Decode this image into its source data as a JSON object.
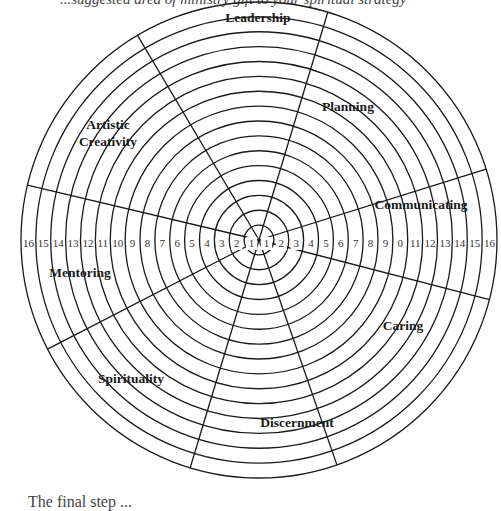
{
  "header": {
    "cut_off_text": "...suggested area of ministry gift to your spiritual strategy"
  },
  "footer": {
    "cut_off_text": "The final step ..."
  },
  "wheel": {
    "title": "Ministry gifts wheel",
    "center": [
      259,
      240
    ],
    "outer_radius": 238,
    "ring_count": 16,
    "ring_numbers": [
      "1",
      "2",
      "3",
      "4",
      "5",
      "6",
      "7",
      "8",
      "9",
      "10",
      "11",
      "12",
      "13",
      "14",
      "15",
      "16"
    ],
    "ring_numbers_right_visible": [
      "1",
      "2",
      "3",
      "4",
      "5",
      "6",
      "7",
      "8",
      "9",
      "0",
      "11",
      "12",
      "13",
      "14",
      "15",
      "16"
    ],
    "spoke_angles_deg": [
      -73.2,
      -17.3,
      14.5,
      70.9,
      106.8,
      152.7,
      193.3,
      239.3
    ],
    "line_color": "#1a1a1a",
    "segments": [
      {
        "name": "Leadership",
        "x": 258,
        "y": 22
      },
      {
        "name": "Planning",
        "x": 348,
        "y": 111
      },
      {
        "name": "Communicating",
        "x": 421,
        "y": 209
      },
      {
        "name": "Caring",
        "x": 403,
        "y": 330
      },
      {
        "name": "Discernment",
        "x": 297,
        "y": 427
      },
      {
        "name": "Spirituality",
        "x": 131,
        "y": 383
      },
      {
        "name": "Mentoring",
        "x": 80,
        "y": 277
      },
      {
        "name": "Artistic",
        "x": 108,
        "y": 129
      },
      {
        "name": "Creativity",
        "x": 108,
        "y": 146
      }
    ]
  }
}
